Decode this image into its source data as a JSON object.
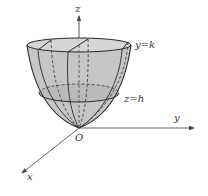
{
  "figure": {
    "axes": {
      "x_label": "x",
      "y_label": "y",
      "z_label": "z",
      "origin_label": "O"
    },
    "annotations": {
      "top_plane": "y=k",
      "section_plane": "z=h"
    },
    "colors": {
      "surface_fill": "#c4c4c4",
      "section_fill": "#b4b4b4",
      "line": "#2a2a2a",
      "axis": "#555555",
      "background": "#ffffff"
    }
  }
}
